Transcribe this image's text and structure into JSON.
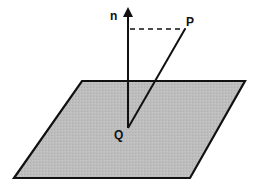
{
  "diagram": {
    "labels": {
      "normal": "n",
      "point_p": "P",
      "point_q": "Q"
    },
    "colors": {
      "plane_fill": "#bdbdbd",
      "stroke": "#111111",
      "background": "#ffffff"
    },
    "elements": [
      {
        "type": "plane",
        "shape": "parallelogram"
      },
      {
        "type": "normal-vector",
        "label": "n",
        "from": "Q"
      },
      {
        "type": "segment",
        "from": "Q",
        "to": "P"
      },
      {
        "type": "dashed-segment",
        "from": "normal-axis",
        "to": "P"
      }
    ]
  }
}
